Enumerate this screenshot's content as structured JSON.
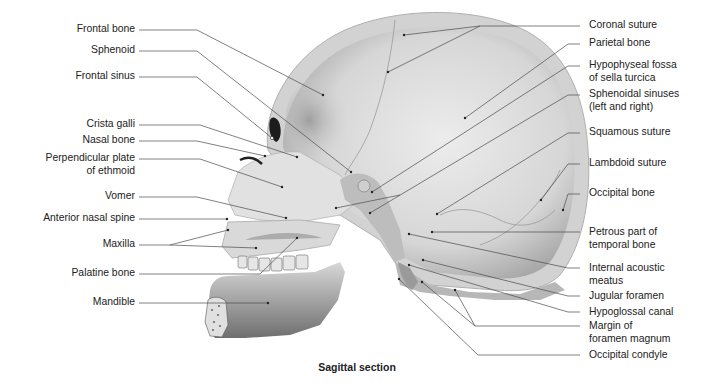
{
  "figure": {
    "caption": "Sagittal section"
  },
  "labels_left": [
    {
      "id": "frontal-bone",
      "text": "Frontal bone",
      "lines": [
        "Frontal bone"
      ]
    },
    {
      "id": "sphenoid",
      "text": "Sphenoid",
      "lines": [
        "Sphenoid"
      ]
    },
    {
      "id": "frontal-sinus",
      "text": "Frontal sinus",
      "lines": [
        "Frontal sinus"
      ]
    },
    {
      "id": "crista-galli",
      "text": "Crista galli",
      "lines": [
        "Crista galli"
      ]
    },
    {
      "id": "nasal-bone",
      "text": "Nasal bone",
      "lines": [
        "Nasal bone"
      ]
    },
    {
      "id": "perpendicular-plate",
      "text": "Perpendicular plate of ethmoid",
      "lines": [
        "Perpendicular plate",
        "of ethmoid"
      ]
    },
    {
      "id": "vomer",
      "text": "Vomer",
      "lines": [
        "Vomer"
      ]
    },
    {
      "id": "anterior-nasal-spine",
      "text": "Anterior nasal spine",
      "lines": [
        "Anterior nasal spine"
      ]
    },
    {
      "id": "maxilla",
      "text": "Maxilla",
      "lines": [
        "Maxilla"
      ]
    },
    {
      "id": "palatine-bone",
      "text": "Palatine bone",
      "lines": [
        "Palatine bone"
      ]
    },
    {
      "id": "mandible",
      "text": "Mandible",
      "lines": [
        "Mandible"
      ]
    }
  ],
  "labels_right": [
    {
      "id": "coronal-suture",
      "text": "Coronal suture",
      "lines": [
        "Coronal suture"
      ]
    },
    {
      "id": "parietal-bone",
      "text": "Parietal bone",
      "lines": [
        "Parietal bone"
      ]
    },
    {
      "id": "hypophyseal-fossa",
      "text": "Hypophyseal fossa of sella turcica",
      "lines": [
        "Hypophyseal fossa",
        "of sella turcica"
      ]
    },
    {
      "id": "sphenoidal-sinuses",
      "text": "Sphenoidal sinuses (left and right)",
      "lines": [
        "Sphenoidal sinuses",
        "(left and right)"
      ]
    },
    {
      "id": "squamous-suture",
      "text": "Squamous suture",
      "lines": [
        "Squamous suture"
      ]
    },
    {
      "id": "lambdoid-suture",
      "text": "Lambdoid suture",
      "lines": [
        "Lambdoid suture"
      ]
    },
    {
      "id": "occipital-bone",
      "text": "Occipital bone",
      "lines": [
        "Occipital bone"
      ]
    },
    {
      "id": "petrous-part",
      "text": "Petrous part of temporal bone",
      "lines": [
        "Petrous part of",
        "temporal bone"
      ]
    },
    {
      "id": "internal-acoustic-meatus",
      "text": "Internal acoustic meatus",
      "lines": [
        "Internal acoustic",
        "meatus"
      ]
    },
    {
      "id": "jugular-foramen",
      "text": "Jugular foramen",
      "lines": [
        "Jugular foramen"
      ]
    },
    {
      "id": "hypoglossal-canal",
      "text": "Hypoglossal canal",
      "lines": [
        "Hypoglossal canal"
      ]
    },
    {
      "id": "margin-foramen-magnum",
      "text": "Margin of foramen magnum",
      "lines": [
        "Margin of",
        "foramen magnum"
      ]
    },
    {
      "id": "occipital-condyle",
      "text": "Occipital condyle",
      "lines": [
        "Occipital condyle"
      ]
    }
  ],
  "colors": {
    "leader_line": "#4a4a4a",
    "bone_light": "#e4e4e4",
    "bone_mid": "#c9c9c9",
    "bone_dark": "#8e8e8e",
    "text": "#222222"
  }
}
